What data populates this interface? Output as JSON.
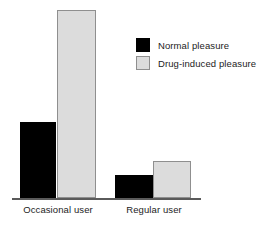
{
  "chart_data": {
    "type": "bar",
    "title": "",
    "subtitle": "",
    "xlabel": "",
    "ylabel": "",
    "categories": [
      "Occasional user",
      "Regular user"
    ],
    "series": [
      {
        "name": "Normal pleasure",
        "values": [
          40,
          12
        ],
        "color": "#000000"
      },
      {
        "name": "Drug-induced pleasure",
        "values": [
          100,
          20
        ],
        "color": "#dcdcdc"
      }
    ],
    "ylim": [
      0,
      100
    ],
    "grid": false,
    "y_axis_visible": false,
    "x_axis_visible": true,
    "legend_position": "top-right",
    "annotations": []
  },
  "axis": {
    "baseline_color": "#5a5a5a"
  },
  "categories": {
    "0": "Occasional user",
    "1": "Regular user"
  },
  "legend": {
    "items": [
      {
        "label": "Normal pleasure",
        "color": "#000000"
      },
      {
        "label": "Drug-induced pleasure",
        "color": "#dcdcdc"
      }
    ]
  },
  "colors": {
    "normal_pleasure": "#000000",
    "drug_induced_pleasure": "#dcdcdc",
    "drug_induced_border": "#8f8f8f",
    "axis": "#5a5a5a",
    "text": "#1c1c1c",
    "background": "#ffffff"
  }
}
